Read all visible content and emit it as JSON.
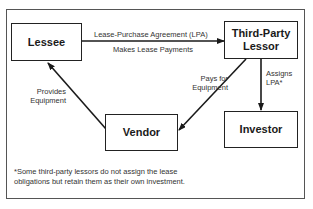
{
  "diagram": {
    "nodes": {
      "lessee": "Lessee",
      "lessor_line1": "Third-Party",
      "lessor_line2": "Lessor",
      "vendor": "Vendor",
      "investor": "Investor"
    },
    "edges": {
      "lessee_to_lessor_top": "Lease-Purchase Agreement (LPA)",
      "lessee_to_lessor_bottom": "Makes Lease Payments",
      "lessor_to_vendor_line1": "Pays for",
      "lessor_to_vendor_line2": "Equipment",
      "vendor_to_lessee_line1": "Provides",
      "vendor_to_lessee_line2": "Equipment",
      "lessor_to_investor_line1": "Assigns",
      "lessor_to_investor_line2": "LPA*"
    },
    "footnote_line1": "*Some third-party lessors do not assign the lease",
    "footnote_line2": "obligations but retain them as their own investment.",
    "colors": {
      "stroke": "#1a1a1a",
      "frame": "#555555",
      "text": "#333333"
    }
  }
}
